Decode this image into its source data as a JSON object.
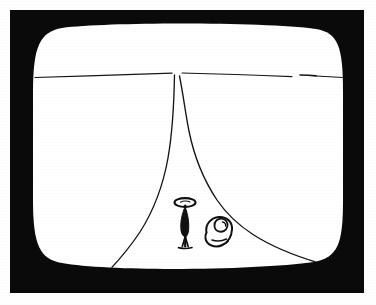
{
  "page": {
    "width": 376,
    "height": 305,
    "background_color": "#ffffff",
    "caption": ""
  },
  "device": {
    "kind": "crt-television",
    "bezel_color": "#0a0a0a",
    "screen_color": "#ffffff",
    "bezel": {
      "x": 10,
      "y": 10,
      "width": 354,
      "height": 283
    },
    "screen_bounds": {
      "x": 33,
      "y": 28,
      "width": 310,
      "height": 238
    }
  },
  "artwork": {
    "title": "Hand-drawn perspective landscape on a television screen",
    "medium": "ink line drawing",
    "ink_color": "#121212",
    "elements": [
      {
        "name": "horizon-line",
        "description": "Thin nearly-horizontal ink line crossing the full width of the screen with a small break near the right side",
        "y_left": 77,
        "y_center": 73,
        "y_right": 78,
        "has_gap": true,
        "gap_x_start": 292,
        "gap_x_end": 303
      },
      {
        "name": "vanishing-point",
        "description": "Point where the two valley edges converge, just below the horizon",
        "x": 176,
        "y": 74
      },
      {
        "name": "left-valley-edge",
        "description": "Curve falling from the vanishing point, bowing right then sweeping down to the lower-left corner of the screen",
        "from": [
          174,
          76
        ],
        "to": [
          88,
          290
        ]
      },
      {
        "name": "right-valley-edge",
        "description": "Curve falling from the vanishing point, bowing left then sweeping down to the lower-right corner of the screen",
        "from": [
          180,
          78
        ],
        "to": [
          318,
          262
        ]
      },
      {
        "name": "figure-with-parasol",
        "description": "Small standing stick figure holding an oval parasol or wearing a halo, with a narrow body and a flared base",
        "x": 184,
        "y": 222,
        "height": 48
      },
      {
        "name": "rounded-blob-figure",
        "description": "Small rounded blob shape with an inner notch, resembling a seated companion or a boulder",
        "x": 212,
        "y": 229,
        "height": 32
      }
    ]
  },
  "labels": {
    "screen": "television screen",
    "bezel": "television bezel",
    "scene": "line drawing scene"
  }
}
